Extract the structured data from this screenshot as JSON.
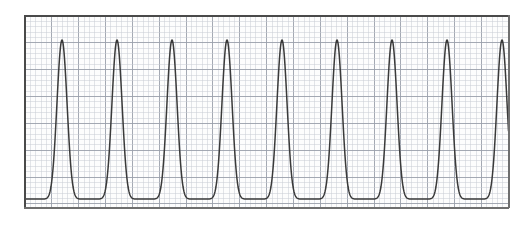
{
  "figure": {
    "background_color": "#ffffff",
    "canvas_width": 532,
    "canvas_height": 228,
    "caption": ""
  },
  "frame": {
    "x": 25,
    "y": 16,
    "width": 483,
    "height": 191,
    "border_color": "#4a4a4a",
    "border_color_light": "#6f6f6f",
    "border_width": 2,
    "fill_color": "#fdfdfd"
  },
  "grid": {
    "minor_spacing_px": 5.37,
    "major_spacing_px": 26.85,
    "minor_color": "#c8ccd4",
    "major_color": "#9aa0ab",
    "minor_width": 0.5,
    "major_width": 0.9,
    "visible": true
  },
  "curve": {
    "color": "#3a3a3a",
    "width": 1.5,
    "style": "solid",
    "peak_count_full": 9,
    "partial_rising_edge_at_right": true
  },
  "chart_data": {
    "type": "line",
    "title": "",
    "subtitle": "",
    "xlabel": "",
    "ylabel": "",
    "grid": true,
    "legend": null,
    "legend_position": "none",
    "xlim": [
      0,
      483
    ],
    "ylim": [
      0,
      191
    ],
    "axis_ticks_labeled": false,
    "waveform": {
      "description": "Periodic wave with narrow sharp peaks and broad rounded troughs",
      "period_px": 55.0,
      "first_peak_x_px": 62,
      "peak_y_px": 40,
      "trough_y_px": 199,
      "amplitude_px": 159,
      "peak_sharpness": 6.0,
      "peak_x_positions_px": [
        62,
        117,
        172,
        227,
        282,
        337,
        392,
        447,
        502
      ],
      "trough_x_positions_px": [
        89,
        144,
        199,
        254,
        309,
        364,
        419,
        474
      ],
      "clipped_left_edge_value_px": 195,
      "clipped_right_edge_value_px": 46
    },
    "series": [
      {
        "name": "waveform",
        "color": "#3a3a3a",
        "x": [
          25,
          30,
          35,
          40,
          45,
          50,
          55,
          60,
          62,
          65,
          70,
          75,
          80,
          85,
          90,
          95,
          100,
          105,
          110,
          115,
          117,
          120,
          125,
          130,
          135,
          140,
          145,
          150,
          155,
          160,
          165,
          170,
          172,
          175,
          180,
          185,
          190,
          195,
          200,
          205,
          210,
          215,
          220,
          225,
          227,
          230,
          235,
          240,
          245,
          250,
          255,
          260,
          265,
          270,
          275,
          280,
          282,
          285,
          290,
          295,
          300,
          305,
          310,
          315,
          320,
          325,
          330,
          335,
          337,
          340,
          345,
          350,
          355,
          360,
          365,
          370,
          375,
          380,
          385,
          390,
          392,
          395,
          400,
          405,
          410,
          415,
          420,
          425,
          430,
          435,
          440,
          445,
          447,
          450,
          455,
          460,
          465,
          470,
          475,
          480,
          485,
          490,
          495,
          500,
          502,
          505,
          508
        ],
        "y": [
          199,
          190,
          172,
          145,
          110,
          76,
          50,
          41,
          40,
          45,
          70,
          105,
          140,
          168,
          187,
          196,
          199,
          198,
          193,
          181,
          176,
          166,
          139,
          104,
          71,
          48,
          41,
          43,
          62,
          95,
          131,
          161,
          168,
          180,
          194,
          199,
          199,
          196,
          189,
          175,
          150,
          116,
          80,
          52,
          45,
          41,
          54,
          84,
          120,
          152,
          175,
          191,
          198,
          199,
          197,
          191,
          187,
          179,
          158,
          126,
          91,
          61,
          44,
          40,
          47,
          68,
          102,
          137,
          148,
          166,
          186,
          197,
          199,
          198,
          194,
          183,
          163,
          134,
          100,
          68,
          58,
          47,
          40,
          43,
          60,
          91,
          127,
          158,
          180,
          194,
          199,
          198,
          197,
          193,
          181,
          159,
          126,
          92,
          62,
          45,
          40,
          45,
          67,
          105,
          120,
          148,
          182
        ]
      }
    ]
  }
}
